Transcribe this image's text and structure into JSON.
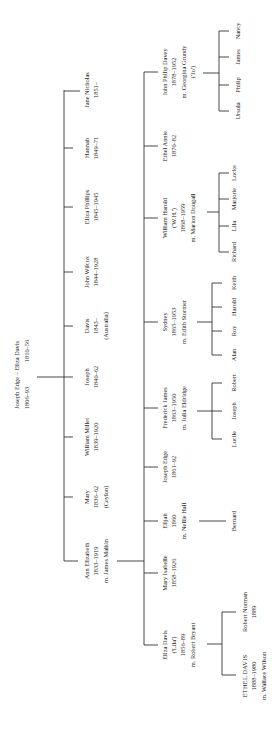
{
  "orientation": "rotated 90 degrees counter-clockwise",
  "root": {
    "line1": "Joseph Edge – Eliza Davis",
    "line2a": "1806–93",
    "line2b": "1810–56"
  },
  "generation1": [
    {
      "name": "Ann Elizabeth",
      "dates": "1833–1919",
      "note": "m. James Malkin"
    },
    {
      "name": "Mary",
      "dates": "1836–62",
      "note": "(Ceylon)"
    },
    {
      "name": "William Millet",
      "dates": "1839–1920",
      "note": ""
    },
    {
      "name": "Joseph",
      "dates": "1840–62",
      "note": ""
    },
    {
      "name": "Davis",
      "dates": "1843–",
      "note": "(Australia)"
    },
    {
      "name": "John Wilcox",
      "dates": "1844–1928",
      "note": ""
    },
    {
      "name": "Eliza Phillips",
      "dates": "1845–1945",
      "note": ""
    },
    {
      "name": "Hannah",
      "dates": "1849–71",
      "note": ""
    },
    {
      "name": "Jane Nicholas",
      "dates": "1851–",
      "note": ""
    }
  ],
  "generation2": [
    {
      "name": "Eliza Davis",
      "nick": "('Lila')",
      "dates": "1856–89",
      "note": "m. Robert Bryant"
    },
    {
      "name": "Mary Isabelle",
      "nick": "",
      "dates": "1858–1926",
      "note": ""
    },
    {
      "name": "Elijah",
      "nick": "",
      "dates": "1860",
      "note": "m. Nellie Hall"
    },
    {
      "name": "Joseph Edge",
      "nick": "",
      "dates": "1861–92",
      "note": ""
    },
    {
      "name": "Frederick James",
      "nick": "",
      "dates": "1863–1950",
      "note": "m. Julia Eldridge"
    },
    {
      "name": "Sydney",
      "nick": "",
      "dates": "1865–1953",
      "note": "m. Edith Stormer"
    },
    {
      "name": "William Harold",
      "nick": "('W.H.')",
      "dates": "1868–1959",
      "note": "m. Marion Dougall"
    },
    {
      "name": "Ethel Annie",
      "nick": "",
      "dates": "1870–82",
      "note": ""
    },
    {
      "name": "John Philip Davey",
      "nick": "",
      "dates": "1878–1952",
      "note": "m. Georgina Grundy",
      "extra": "('Jo')"
    }
  ],
  "generation3": {
    "bryant": [
      {
        "name": "ETHEL DAVIS",
        "dates": "1888–1980",
        "note": "m. Wallace Wilson"
      },
      {
        "name": "Robert Norman",
        "dates": "1889",
        "note": ""
      }
    ],
    "elijah": [
      "Bernard"
    ],
    "frederick": [
      "Lucile",
      "Joseph",
      "Robert"
    ],
    "sydney": [
      "Alan",
      "Roy",
      "Harold",
      "Keith"
    ],
    "william": [
      "Richard",
      "Lila",
      "Marjorie",
      "Locke"
    ],
    "john": [
      "Ursula",
      "Philip",
      "James",
      "Nancy"
    ]
  }
}
